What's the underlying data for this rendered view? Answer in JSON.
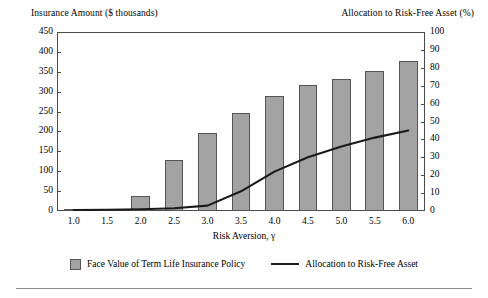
{
  "chart_data": {
    "type": "bar",
    "title": "",
    "xlabel": "Risk Aversion, γ",
    "categories": [
      "1.0",
      "1.5",
      "2.0",
      "2.5",
      "3.0",
      "3.5",
      "4.0",
      "4.5",
      "5.0",
      "5.5",
      "6.0"
    ],
    "x": [
      1.0,
      1.5,
      2.0,
      2.5,
      3.0,
      3.5,
      4.0,
      4.5,
      5.0,
      5.5,
      6.0
    ],
    "grid": false,
    "legend_position": "bottom",
    "left_axis": {
      "label": "Insurance Amount ($ thousands)",
      "ylim": [
        0,
        450
      ],
      "ticks": [
        0,
        50,
        100,
        150,
        200,
        250,
        300,
        350,
        400,
        450
      ]
    },
    "right_axis": {
      "label": "Allocation to Risk-Free Asset (%)",
      "ylim": [
        0,
        100
      ],
      "ticks": [
        0,
        10,
        20,
        30,
        40,
        50,
        60,
        70,
        80,
        90,
        100
      ]
    },
    "series": [
      {
        "name": "Face Value of Term Life Insurance Policy",
        "type": "bar",
        "axis": "left",
        "color": "#a3a3a3",
        "values": [
          5,
          5,
          38,
          128,
          196,
          246,
          288,
          317,
          332,
          352,
          377
        ]
      },
      {
        "name": "Allocation to Risk-Free Asset",
        "type": "line",
        "axis": "right",
        "color": "#1a1a1a",
        "values": [
          0.5,
          0.7,
          1.0,
          1.5,
          3.0,
          11.0,
          22.0,
          30.0,
          36.0,
          41.0,
          45.0
        ]
      }
    ]
  },
  "legend": {
    "bar_label": "Face Value of Term Life Insurance Policy",
    "line_label": "Allocation to Risk-Free Asset"
  }
}
